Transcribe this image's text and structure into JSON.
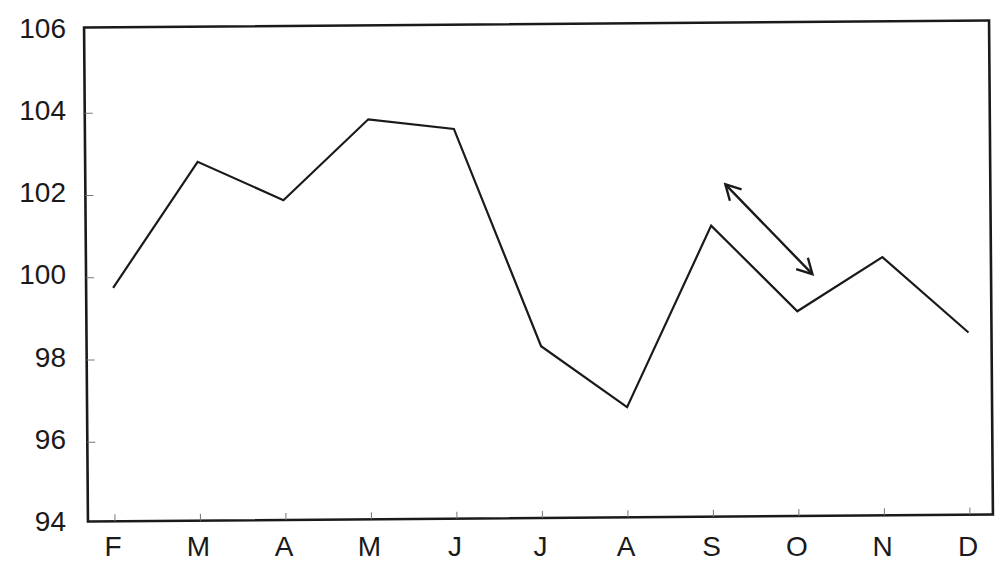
{
  "chart_data": {
    "type": "line",
    "title": "",
    "title_note": "title cropped at top edge, unreadable",
    "xlabel": "",
    "ylabel": "",
    "categories": [
      "F",
      "M",
      "A",
      "M",
      "J",
      "J",
      "A",
      "S",
      "O",
      "N",
      "D"
    ],
    "series": [
      {
        "name": "series",
        "values": [
          99.75,
          102.8,
          101.85,
          103.8,
          103.55,
          98.25,
          96.75,
          101.15,
          99.05,
          100.35,
          98.5
        ]
      }
    ],
    "ylim": [
      94,
      106
    ],
    "yticks": [
      94,
      96,
      98,
      100,
      102,
      104,
      106
    ],
    "ytick_labels": [
      "94",
      "96",
      "98",
      "100",
      "102",
      "104",
      "106"
    ],
    "grid": false,
    "legend": null,
    "annotations": [
      {
        "type": "double-headed-arrow",
        "from": {
          "x_index": 7.17,
          "y": 102.15
        },
        "to": {
          "x_index": 8.18,
          "y": 99.95
        }
      }
    ],
    "colors": {
      "line": "#1a1a1a",
      "frame": "#1a1a1a",
      "background": "#ffffff"
    }
  }
}
